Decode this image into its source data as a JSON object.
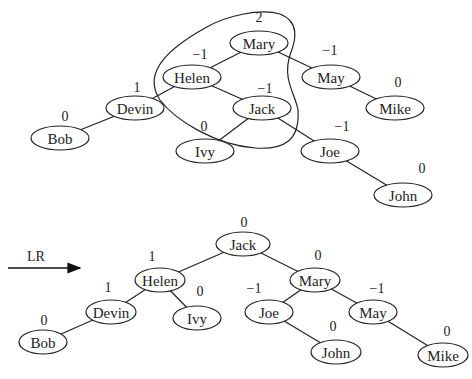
{
  "diagram": {
    "type": "avl-tree-rotation",
    "rotation_label": "LR",
    "top_tree": {
      "nodes": [
        {
          "id": "Mary",
          "label": "Mary",
          "balance": "2",
          "x": 259,
          "y": 43
        },
        {
          "id": "Helen",
          "label": "Helen",
          "balance": "−1",
          "x": 192,
          "y": 77
        },
        {
          "id": "May",
          "label": "May",
          "balance": "−1",
          "x": 331,
          "y": 77
        },
        {
          "id": "Devin",
          "label": "Devin",
          "balance": "1",
          "x": 135,
          "y": 108
        },
        {
          "id": "Jack",
          "label": "Jack",
          "balance": "−1",
          "x": 262,
          "y": 108
        },
        {
          "id": "Mike",
          "label": "Mike",
          "balance": "0",
          "x": 395,
          "y": 108
        },
        {
          "id": "Bob",
          "label": "Bob",
          "balance": "0",
          "x": 60,
          "y": 138
        },
        {
          "id": "Ivy",
          "label": "Ivy",
          "balance": "0",
          "x": 205,
          "y": 151
        },
        {
          "id": "Joe",
          "label": "Joe",
          "balance": "−1",
          "x": 330,
          "y": 151
        },
        {
          "id": "John",
          "label": "John",
          "balance": "0",
          "x": 403,
          "y": 195
        }
      ],
      "edges": [
        [
          "Mary",
          "Helen"
        ],
        [
          "Mary",
          "May"
        ],
        [
          "Helen",
          "Devin"
        ],
        [
          "Helen",
          "Jack"
        ],
        [
          "May",
          "Mike"
        ],
        [
          "Devin",
          "Bob"
        ],
        [
          "Jack",
          "Ivy"
        ],
        [
          "Jack",
          "Joe"
        ],
        [
          "Joe",
          "John"
        ]
      ],
      "highlight_group": [
        "Mary",
        "Helen",
        "Jack"
      ]
    },
    "bottom_tree": {
      "nodes": [
        {
          "id": "Jack",
          "label": "Jack",
          "balance": "0",
          "x": 243,
          "y": 244
        },
        {
          "id": "Helen",
          "label": "Helen",
          "balance": "1",
          "x": 160,
          "y": 280
        },
        {
          "id": "Mary",
          "label": "Mary",
          "balance": "0",
          "x": 315,
          "y": 280
        },
        {
          "id": "Devin",
          "label": "Devin",
          "balance": "1",
          "x": 111,
          "y": 312
        },
        {
          "id": "Ivy",
          "label": "Ivy",
          "balance": "0",
          "x": 197,
          "y": 318
        },
        {
          "id": "Joe",
          "label": "Joe",
          "balance": "−1",
          "x": 269,
          "y": 312
        },
        {
          "id": "May",
          "label": "May",
          "balance": "−1",
          "x": 373,
          "y": 312
        },
        {
          "id": "Bob",
          "label": "Bob",
          "balance": "0",
          "x": 43,
          "y": 342
        },
        {
          "id": "John",
          "label": "John",
          "balance": "0",
          "x": 336,
          "y": 352
        },
        {
          "id": "Mike",
          "label": "Mike",
          "balance": "0",
          "x": 443,
          "y": 355
        }
      ],
      "edges": [
        [
          "Jack",
          "Helen"
        ],
        [
          "Jack",
          "Mary"
        ],
        [
          "Helen",
          "Devin"
        ],
        [
          "Helen",
          "Ivy"
        ],
        [
          "Mary",
          "Joe"
        ],
        [
          "Mary",
          "May"
        ],
        [
          "Devin",
          "Bob"
        ],
        [
          "Joe",
          "John"
        ],
        [
          "May",
          "Mike"
        ]
      ]
    }
  }
}
